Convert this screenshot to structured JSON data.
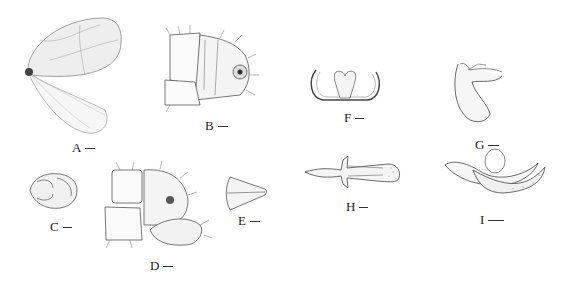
{
  "plate": {
    "panels": [
      {
        "id": "A",
        "label": "A",
        "subject": "forewing and hindwing"
      },
      {
        "id": "B",
        "label": "B",
        "subject": "male terminalia, lateral view"
      },
      {
        "id": "C",
        "label": "C",
        "subject": "head capsule"
      },
      {
        "id": "D",
        "label": "D",
        "subject": "terminalia, lateral view"
      },
      {
        "id": "E",
        "label": "E",
        "subject": "conical segment"
      },
      {
        "id": "F",
        "label": "F",
        "subject": "sclerite, U-shaped"
      },
      {
        "id": "G",
        "label": "G",
        "subject": "genital structure, lateral"
      },
      {
        "id": "H",
        "label": "H",
        "subject": "phallus, dorsal view"
      },
      {
        "id": "I",
        "label": "I",
        "subject": "phallus, lateral view"
      }
    ],
    "colors": {
      "ink": "#333333",
      "shade": "#cccccc",
      "background": "#ffffff"
    }
  }
}
